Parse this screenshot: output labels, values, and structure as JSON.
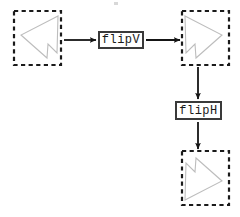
{
  "diagram": {
    "type": "shape-transformation-flow",
    "title": "",
    "colors": {
      "shape_stroke": "#b9b9b9",
      "box_border": "#3a3a3a",
      "dashed_border": "#1a1a1a",
      "arrow": "#1a1a1a",
      "background": "#ffffff"
    },
    "operations": [
      {
        "id": "flipV",
        "label": "flipV"
      },
      {
        "id": "flipH",
        "label": "flipH"
      }
    ],
    "panels": [
      {
        "id": "panel-input",
        "name": "input-shape-panel",
        "position": {
          "x": 14,
          "y": 11,
          "width": 47,
          "height": 54
        },
        "shape_name": "arrow-polygon-pointing-left",
        "points": "44,5 7,24 33,47 34,33 43,42"
      },
      {
        "id": "panel-mid",
        "name": "intermediate-shape-panel",
        "position": {
          "x": 182,
          "y": 11,
          "width": 47,
          "height": 54
        },
        "shape_name": "arrow-polygon-pointing-right",
        "points": "3,5 40,24 14,47 13,33 4,42"
      },
      {
        "id": "panel-output",
        "name": "output-shape-panel",
        "position": {
          "x": 182,
          "y": 151,
          "width": 47,
          "height": 54
        },
        "shape_name": "arrow-polygon-pointing-right-flipped",
        "points": "3,47 40,28 14,5 13,19 4,10"
      }
    ],
    "arrows": [
      {
        "id": "arrow-input-to-flipv",
        "from": "panel-input",
        "to": "op-box-flipv",
        "direction": "right"
      },
      {
        "id": "arrow-flipv-to-mid",
        "from": "op-box-flipv",
        "to": "panel-mid",
        "direction": "right"
      },
      {
        "id": "arrow-mid-to-fliph",
        "from": "panel-mid",
        "to": "op-box-fliph",
        "direction": "down"
      },
      {
        "id": "arrow-fliph-to-output",
        "from": "op-box-fliph",
        "to": "panel-output",
        "direction": "down"
      }
    ]
  }
}
